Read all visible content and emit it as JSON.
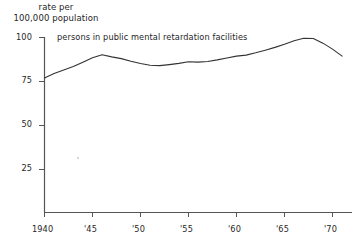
{
  "chart_data": {
    "type": "line",
    "title": "",
    "ylabel_line1": "rate per",
    "ylabel_line2": "100,000 population",
    "xlabel": "",
    "annotation": "persons in public mental retardation facilities",
    "grid": false,
    "legend_position": "inline-annotation",
    "xlim": [
      1940,
      1971
    ],
    "ylim": [
      0,
      100
    ],
    "yticks": [
      "100",
      "75",
      "50",
      "25"
    ],
    "ytick_values": [
      100,
      75,
      50,
      25
    ],
    "xticks": [
      "1940",
      "'45",
      "'50",
      "'55",
      "'60",
      "'65",
      "'70"
    ],
    "xtick_values": [
      1940,
      1945,
      1950,
      1955,
      1960,
      1965,
      1970
    ],
    "line_color": "#333333",
    "axis_color": "#555555",
    "series": [
      {
        "name": "persons in public mental retardation facilities",
        "x": [
          1940,
          1941,
          1942,
          1943,
          1944,
          1945,
          1946,
          1947,
          1948,
          1949,
          1950,
          1951,
          1952,
          1953,
          1954,
          1955,
          1956,
          1957,
          1958,
          1959,
          1960,
          1961,
          1962,
          1963,
          1964,
          1965,
          1966,
          1967,
          1968,
          1969,
          1970,
          1971
        ],
        "values": [
          77.0,
          79.5,
          81.5,
          83.5,
          86.0,
          88.5,
          90.2,
          89.0,
          88.0,
          86.5,
          85.2,
          84.2,
          84.0,
          84.6,
          85.3,
          86.2,
          86.0,
          86.4,
          87.3,
          88.4,
          89.4,
          90.0,
          91.3,
          92.8,
          94.4,
          96.2,
          98.2,
          99.6,
          99.4,
          96.8,
          93.4,
          89.4
        ]
      }
    ]
  },
  "artifacts": {
    "speck_label": "scan-speck"
  }
}
